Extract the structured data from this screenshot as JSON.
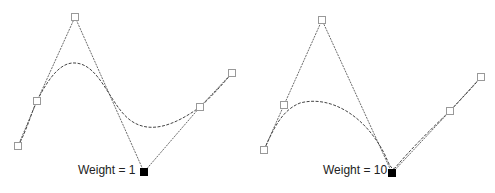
{
  "diagrams": [
    {
      "label": "Weight = 1",
      "control_points": [
        [
          18,
          146
        ],
        [
          37,
          101
        ],
        [
          75,
          17
        ],
        [
          144,
          172
        ],
        [
          200,
          107
        ],
        [
          232,
          73
        ]
      ],
      "weighted_index": 3,
      "curve_path": "M18,146 C28,128 32,110 37,101 C50,75 62,62 75,63 C100,64 110,105 130,120 C150,135 175,125 200,107 C212,96 222,85 232,73"
    },
    {
      "label": "Weight = 10",
      "control_points": [
        [
          264,
          150
        ],
        [
          284,
          105
        ],
        [
          322,
          20
        ],
        [
          392,
          173
        ],
        [
          450,
          111
        ],
        [
          481,
          77
        ]
      ],
      "weighted_index": 3,
      "curve_path": "M264,150 C275,125 283,110 300,103 C330,95 365,115 385,155 C389,164 391,170 395,168 C410,150 430,130 450,111 C462,98 472,88 481,77"
    }
  ],
  "colors": {
    "line": "#444444",
    "point_fill": "#ffffff",
    "point_stroke": "#999999",
    "weighted_fill": "#000000"
  }
}
